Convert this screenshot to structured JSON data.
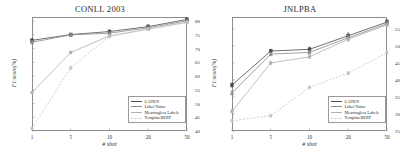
{
  "figure": {
    "background": "#ffffff",
    "panel_count": 2
  },
  "legend": {
    "entries": [
      {
        "label": "LADEN",
        "color": "#4a4a4a",
        "dash": "none",
        "marker": "square"
      },
      {
        "label": "Label Name",
        "color": "#8a8a8a",
        "dash": "none",
        "marker": "triangle"
      },
      {
        "label": "Meaningless Labels",
        "color": "#b0b0b0",
        "dash": "none",
        "marker": "circle"
      },
      {
        "label": "TemplateBERT",
        "color": "#c2c2c2",
        "dash": "dotted",
        "marker": "diamond"
      }
    ]
  },
  "chart_data": [
    {
      "type": "line",
      "title": "CONLL 2003",
      "xlabel": "# shot",
      "ylabel": "F1-score(%)",
      "x": [
        1,
        5,
        10,
        20,
        50
      ],
      "xticklabels": [
        "1",
        "5",
        "10",
        "20",
        "50"
      ],
      "ylim": [
        40,
        81.5
      ],
      "yticks": [
        40,
        45,
        50,
        55,
        60,
        65,
        70,
        75,
        80
      ],
      "yticklabels": [
        "40",
        "45",
        "50",
        "55",
        "60",
        "65",
        "70",
        "75",
        "80"
      ],
      "grid": false,
      "legend_position": "lower right",
      "series": [
        {
          "name": "LADEN",
          "values": [
            73.0,
            75.1,
            76.2,
            78.0,
            80.6
          ],
          "errors": [
            0.5,
            0.5,
            0.6,
            0.7,
            0.6
          ]
        },
        {
          "name": "Label Name",
          "values": [
            72.3,
            75.0,
            75.6,
            77.6,
            80.1
          ],
          "errors": [
            0.6,
            0.5,
            0.5,
            0.6,
            0.5
          ]
        },
        {
          "name": "Meaningless Labels",
          "values": [
            54.0,
            68.6,
            74.6,
            77.1,
            79.6
          ],
          "errors": [
            0.4,
            0.4,
            0.4,
            0.5,
            0.4
          ]
        },
        {
          "name": "TemplateBERT",
          "values": [
            41.0,
            63.0,
            74.4,
            77.0,
            79.5
          ],
          "errors": [
            0.4,
            0.4,
            0.4,
            0.4,
            0.4
          ]
        }
      ]
    },
    {
      "type": "line",
      "title": "JNLPBA",
      "xlabel": "# shot",
      "ylabel": "F1-score(%)",
      "x": [
        1,
        5,
        10,
        20,
        50
      ],
      "xticklabels": [
        "1",
        "5",
        "10",
        "20",
        "50"
      ],
      "ylim": [
        25,
        58.5
      ],
      "yticks": [
        25,
        30,
        35,
        40,
        45,
        50,
        55
      ],
      "yticklabels": [
        "25",
        "30",
        "35",
        "40",
        "45",
        "50",
        "55"
      ],
      "grid": false,
      "legend_position": "lower right",
      "series": [
        {
          "name": "LADEN",
          "values": [
            38.5,
            48.5,
            49.0,
            53.0,
            57.0
          ],
          "errors": [
            0.6,
            0.5,
            0.6,
            0.8,
            0.7
          ]
        },
        {
          "name": "Label Name",
          "values": [
            36.2,
            47.6,
            48.1,
            52.4,
            56.5
          ],
          "errors": [
            0.6,
            0.5,
            0.5,
            0.7,
            0.6
          ]
        },
        {
          "name": "Meaningless Labels",
          "values": [
            30.8,
            45.0,
            46.8,
            52.0,
            56.2
          ],
          "errors": [
            0.5,
            0.4,
            0.5,
            0.6,
            0.5
          ]
        },
        {
          "name": "TemplateBERT",
          "values": [
            28.0,
            29.5,
            37.8,
            42.0,
            48.0
          ],
          "errors": [
            0.4,
            0.4,
            0.4,
            0.4,
            0.4
          ]
        }
      ]
    }
  ]
}
